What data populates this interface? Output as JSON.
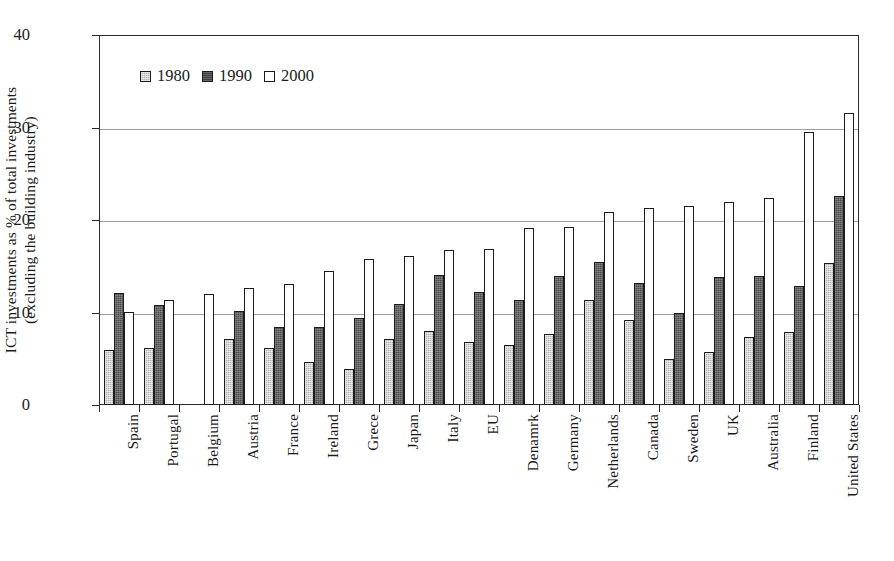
{
  "chart_data": {
    "type": "bar",
    "title": "",
    "xlabel": "",
    "ylabel": "ICT investments as % of total investments\n(excluding the building industry)",
    "ylim": [
      0,
      40
    ],
    "yticks": [
      0,
      10,
      20,
      30,
      40
    ],
    "grid": true,
    "legend_position": "top-left-inside",
    "categories": [
      "Spain",
      "Portugal",
      "Belgium",
      "Austria",
      "France",
      "Ireland",
      "Grece",
      "Japan",
      "Italy",
      "EU",
      "Denamrk",
      "Germany",
      "Netherlands",
      "Canada",
      "Sweden",
      "UK",
      "Australia",
      "Finland",
      "United States"
    ],
    "series": [
      {
        "name": "1980",
        "color": "#b4b4b4",
        "values": [
          5.9,
          6.2,
          null,
          7.1,
          6.2,
          4.6,
          3.9,
          7.1,
          8.0,
          6.8,
          6.5,
          7.7,
          11.3,
          9.2,
          5.0,
          5.7,
          7.4,
          7.9,
          15.3
        ]
      },
      {
        "name": "1990",
        "color": "#4a4a4a",
        "values": [
          12.1,
          10.8,
          null,
          10.2,
          8.4,
          8.4,
          9.4,
          10.9,
          14.1,
          12.2,
          11.3,
          14.0,
          15.5,
          13.2,
          9.9,
          13.8,
          14.0,
          12.9,
          22.6
        ]
      },
      {
        "name": "2000",
        "color": "#ffffff",
        "values": [
          10.1,
          11.3,
          12.0,
          12.7,
          13.1,
          14.5,
          15.8,
          16.1,
          16.8,
          16.9,
          19.1,
          19.2,
          20.9,
          21.3,
          21.5,
          21.9,
          22.4,
          29.5,
          31.6
        ]
      }
    ]
  },
  "legend": {
    "items": [
      {
        "label": "1980",
        "key": "y1980"
      },
      {
        "label": "1990",
        "key": "y1990"
      },
      {
        "label": "2000",
        "key": "y2000"
      }
    ]
  }
}
